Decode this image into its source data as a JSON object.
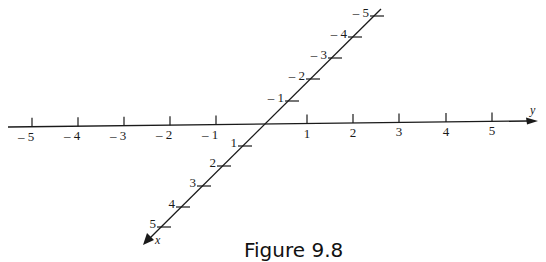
{
  "figure": {
    "caption": "Figure 9.8",
    "y_axis": {
      "name": "y",
      "ticks": [
        {
          "label": "– 5",
          "x": 32
        },
        {
          "label": "– 4",
          "x": 78
        },
        {
          "label": "– 3",
          "x": 124
        },
        {
          "label": "– 2",
          "x": 170
        },
        {
          "label": "– 1",
          "x": 216
        },
        {
          "label": "1",
          "x": 307
        },
        {
          "label": "2",
          "x": 353
        },
        {
          "label": "3",
          "x": 399
        },
        {
          "label": "4",
          "x": 446
        },
        {
          "label": "5",
          "x": 492
        }
      ]
    },
    "x_axis": {
      "name": "x",
      "ticks": [
        {
          "label": "– 5",
          "x": 372,
          "y": 16
        },
        {
          "label": "– 4",
          "x": 350,
          "y": 37
        },
        {
          "label": "– 3",
          "x": 330,
          "y": 58
        },
        {
          "label": "– 2",
          "x": 308,
          "y": 79
        },
        {
          "label": "– 1",
          "x": 287,
          "y": 101
        },
        {
          "label": "1",
          "x": 240,
          "y": 146
        },
        {
          "label": "2",
          "x": 219,
          "y": 166
        },
        {
          "label": "3",
          "x": 199,
          "y": 186
        },
        {
          "label": "4",
          "x": 178,
          "y": 207
        },
        {
          "label": "5",
          "x": 159,
          "y": 227
        }
      ]
    },
    "colors": {
      "ink": "#1a1a1a",
      "background": "#ffffff"
    }
  }
}
